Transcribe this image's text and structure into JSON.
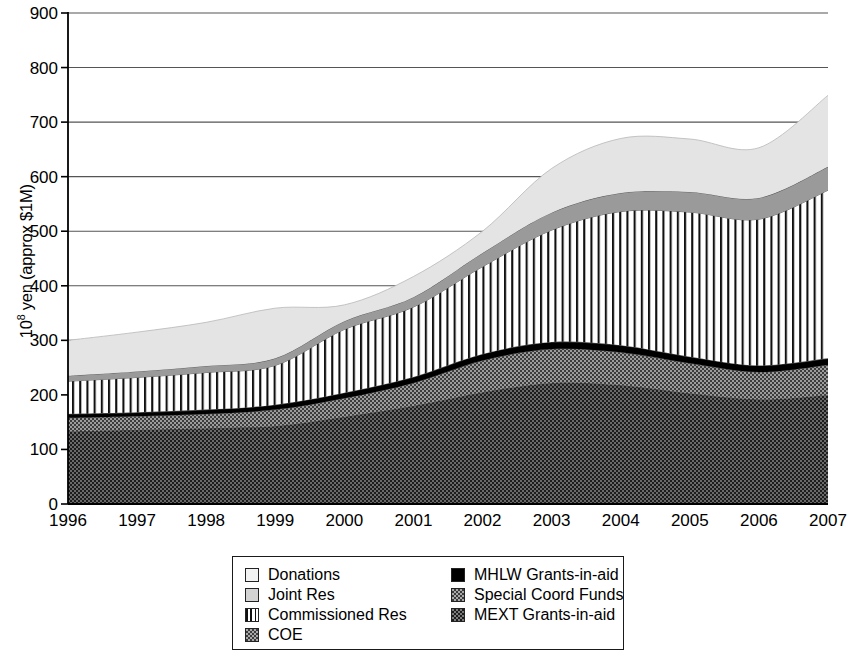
{
  "chart_data": {
    "type": "area",
    "title": "",
    "xlabel": "",
    "ylabel": "10^8 yen (approx $1M)",
    "ylabel_prefix": "10",
    "ylabel_exponent": "8",
    "ylabel_suffix": " yen (approx $1M)",
    "stacked": true,
    "grid": true,
    "legend_position": "bottom",
    "xlim": [
      1996,
      2007
    ],
    "ylim": [
      0,
      900
    ],
    "x": [
      1996,
      1997,
      1998,
      1999,
      2000,
      2001,
      2002,
      2003,
      2004,
      2005,
      2006,
      2007
    ],
    "categories": [
      "1996",
      "1997",
      "1998",
      "1999",
      "2000",
      "2001",
      "2002",
      "2003",
      "2004",
      "2005",
      "2006",
      "2007"
    ],
    "yticks": [
      0,
      100,
      200,
      300,
      400,
      500,
      600,
      700,
      800,
      900
    ],
    "ytick_labels": [
      "0",
      "100",
      "200",
      "300",
      "400",
      "500",
      "600",
      "700",
      "800",
      "900"
    ],
    "stack_order_bottom_to_top": [
      "MEXT Grants-in-aid",
      "Special Coord Funds",
      "MHLW Grants-in-aid",
      "COE",
      "Commissioned Res",
      "Joint Res",
      "Donations"
    ],
    "series": [
      {
        "name": "MEXT Grants-in-aid",
        "fill": "#2b2b2b",
        "values": [
          133,
          136,
          139,
          143,
          160,
          180,
          205,
          222,
          218,
          203,
          192,
          200
        ]
      },
      {
        "name": "Special Coord Funds",
        "fill": "#6e6e6e",
        "values": [
          25,
          25,
          26,
          30,
          34,
          42,
          58,
          62,
          60,
          55,
          50,
          55
        ]
      },
      {
        "name": "MHLW Grants-in-aid",
        "fill": "#000000",
        "values": [
          7,
          7,
          8,
          9,
          10,
          11,
          12,
          13,
          13,
          12,
          12,
          12
        ]
      },
      {
        "name": "COE",
        "fill": "#8a8a8a",
        "values": [
          0,
          0,
          0,
          0,
          0,
          0,
          0,
          0,
          0,
          0,
          0,
          0
        ]
      },
      {
        "name": "Commissioned Res",
        "fill": "#ffffff",
        "pattern": "vertical-stripes",
        "values": [
          60,
          64,
          68,
          72,
          116,
          128,
          160,
          205,
          245,
          265,
          268,
          308
        ]
      },
      {
        "name": "Joint Res",
        "fill": "#9a9a9a",
        "values": [
          10,
          11,
          12,
          13,
          15,
          18,
          25,
          32,
          34,
          37,
          39,
          43
        ]
      },
      {
        "name": "Donations",
        "fill": "#e2e2e2",
        "values": [
          65,
          72,
          80,
          92,
          30,
          38,
          40,
          81,
          100,
          97,
          92,
          131
        ]
      }
    ],
    "totals": [
      300,
      315,
      333,
      359,
      365,
      417,
      500,
      615,
      670,
      669,
      653,
      749
    ],
    "cumulative_boundaries": {
      "mext_top": [
        133,
        136,
        139,
        143,
        160,
        180,
        205,
        222,
        218,
        203,
        192,
        200
      ],
      "special_top": [
        158,
        161,
        165,
        173,
        194,
        222,
        263,
        284,
        278,
        258,
        242,
        255
      ],
      "mhlw_top": [
        165,
        168,
        173,
        182,
        204,
        233,
        275,
        297,
        291,
        270,
        254,
        267
      ],
      "coe_top": [
        165,
        168,
        173,
        182,
        204,
        233,
        275,
        297,
        291,
        270,
        254,
        267
      ],
      "commissioned_top": [
        225,
        232,
        241,
        254,
        320,
        361,
        435,
        502,
        536,
        535,
        522,
        575
      ],
      "joint_top": [
        235,
        243,
        253,
        267,
        335,
        379,
        460,
        534,
        570,
        572,
        561,
        618
      ],
      "donations_top": [
        300,
        315,
        333,
        359,
        365,
        417,
        500,
        615,
        670,
        669,
        653,
        749
      ]
    },
    "legend": {
      "column_left": [
        {
          "label": "Donations",
          "swatch": "donations-swatch"
        },
        {
          "label": "Joint Res",
          "swatch": "joint-res-swatch"
        },
        {
          "label": "Commissioned Res",
          "swatch": "commissioned-res-swatch"
        },
        {
          "label": "COE",
          "swatch": "coe-swatch"
        }
      ],
      "column_right": [
        {
          "label": "MHLW Grants-in-aid",
          "swatch": "mhlw-swatch"
        },
        {
          "label": "Special Coord Funds",
          "swatch": "special-coord-swatch"
        },
        {
          "label": "MEXT Grants-in-aid",
          "swatch": "mext-swatch"
        }
      ]
    },
    "colors": {
      "donations": "#e2e2e2",
      "joint_res": "#9a9a9a",
      "commissioned_res": "#ffffff",
      "coe": "#8a8a8a",
      "mhlw": "#000000",
      "special_coord": "#6e6e6e",
      "mext": "#2b2b2b",
      "axis": "#000000",
      "grid": "#555555"
    }
  }
}
